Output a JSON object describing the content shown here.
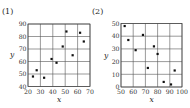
{
  "panels": [
    {
      "label": "(1)"
    },
    {
      "label": "(2)"
    }
  ],
  "chart_data": [
    {
      "type": "scatter",
      "title": "(1)",
      "xlabel": "x",
      "ylabel": "y",
      "xlim": [
        20,
        70
      ],
      "ylim": [
        40,
        90
      ],
      "xticks": [
        20,
        30,
        40,
        50,
        60,
        70
      ],
      "yticks": [
        40,
        50,
        60,
        70,
        80,
        90
      ],
      "grid": true,
      "points": [
        {
          "x": 24,
          "y": 48
        },
        {
          "x": 27,
          "y": 53
        },
        {
          "x": 33,
          "y": 47
        },
        {
          "x": 39,
          "y": 62
        },
        {
          "x": 43,
          "y": 59
        },
        {
          "x": 48,
          "y": 72
        },
        {
          "x": 51,
          "y": 84
        },
        {
          "x": 56,
          "y": 65
        },
        {
          "x": 62,
          "y": 83
        },
        {
          "x": 65,
          "y": 76
        }
      ]
    },
    {
      "type": "scatter",
      "title": "(2)",
      "xlabel": "x",
      "ylabel": "y",
      "xlim": [
        50,
        100
      ],
      "ylim": [
        0,
        50
      ],
      "xticks": [
        50,
        60,
        70,
        80,
        90,
        100
      ],
      "yticks": [
        0,
        10,
        20,
        30,
        40,
        50
      ],
      "grid": true,
      "points": [
        {
          "x": 53,
          "y": 48
        },
        {
          "x": 56,
          "y": 37
        },
        {
          "x": 62,
          "y": 29
        },
        {
          "x": 68,
          "y": 41
        },
        {
          "x": 72,
          "y": 15
        },
        {
          "x": 77,
          "y": 32
        },
        {
          "x": 80,
          "y": 26
        },
        {
          "x": 85,
          "y": 4
        },
        {
          "x": 91,
          "y": 2
        },
        {
          "x": 94,
          "y": 13
        }
      ]
    }
  ]
}
